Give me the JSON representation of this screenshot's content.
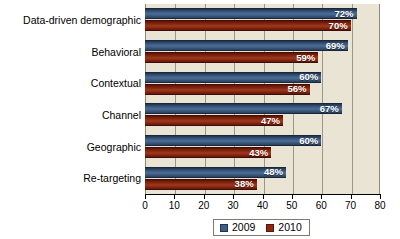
{
  "chart_data": {
    "type": "bar",
    "orientation": "horizontal",
    "title": "",
    "xlabel": "",
    "ylabel": "",
    "xlim": [
      0,
      80
    ],
    "xticks": [
      0,
      10,
      20,
      30,
      40,
      50,
      60,
      70,
      80
    ],
    "grid": true,
    "legend_position": "bottom",
    "categories": [
      "Data-driven demographic",
      "Behavioral",
      "Contextual",
      "Channel",
      "Geographic",
      "Re-targeting"
    ],
    "series": [
      {
        "name": "2009",
        "color": "#3f5f86",
        "values": [
          72,
          69,
          60,
          67,
          60,
          48
        ],
        "labels": [
          "72%",
          "69%",
          "60%",
          "67%",
          "60%",
          "48%"
        ]
      },
      {
        "name": "2010",
        "color": "#8e2a10",
        "values": [
          70,
          59,
          56,
          47,
          43,
          38
        ],
        "labels": [
          "70%",
          "59%",
          "56%",
          "47%",
          "43%",
          "38%"
        ]
      }
    ],
    "tick_labels": [
      "0",
      "10",
      "20",
      "30",
      "40",
      "50",
      "60",
      "70",
      "80"
    ],
    "plot_background": "#e9e4d3",
    "figure_background": "#ffffff"
  }
}
